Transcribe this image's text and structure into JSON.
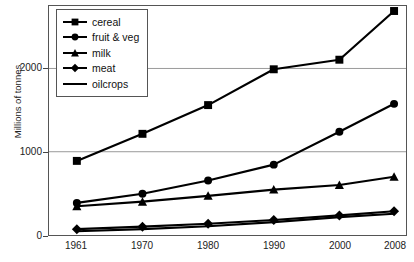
{
  "chart_data": {
    "type": "line",
    "title": "",
    "xlabel": "",
    "ylabel": "Millions of tonnes",
    "categories": [
      "1961",
      "1970",
      "1980",
      "1990",
      "2000",
      "2008"
    ],
    "yticks": [
      0,
      1000,
      2000
    ],
    "ylim": [
      0,
      2750
    ],
    "grid": true,
    "legend_position": "top-left",
    "series": [
      {
        "name": "cereal",
        "marker": "square",
        "values": [
          890,
          1215,
          1560,
          1990,
          2105,
          2690
        ]
      },
      {
        "name": "fruit & veg",
        "marker": "circle",
        "values": [
          385,
          495,
          655,
          845,
          1240,
          1575
        ]
      },
      {
        "name": "milk",
        "marker": "triangle",
        "values": [
          345,
          400,
          470,
          545,
          600,
          700
        ]
      },
      {
        "name": "meat",
        "marker": "diamond",
        "values": [
          70,
          100,
          135,
          180,
          235,
          285
        ]
      },
      {
        "name": "oilcrops",
        "marker": "none",
        "values": [
          45,
          70,
          105,
          155,
          215,
          255
        ]
      }
    ]
  },
  "legend": {
    "items": [
      {
        "label": "cereal",
        "marker": "square-marker-icon"
      },
      {
        "label": "fruit & veg",
        "marker": "circle-marker-icon"
      },
      {
        "label": "milk",
        "marker": "triangle-marker-icon"
      },
      {
        "label": "meat",
        "marker": "diamond-marker-icon"
      },
      {
        "label": "oilcrops",
        "marker": "line-marker-icon"
      }
    ]
  },
  "colors": {
    "series": "#000000",
    "axis": "#555555",
    "grid": "#999999",
    "text": "#222222",
    "background": "#ffffff"
  }
}
